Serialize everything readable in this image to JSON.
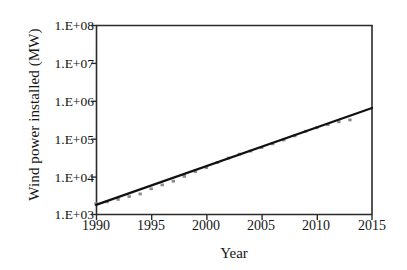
{
  "chart_data": {
    "type": "line",
    "title": "",
    "xlabel": "Year",
    "ylabel": "Wind power installed (MW)",
    "yscale": "log",
    "xlim": [
      1990,
      2015
    ],
    "ylim": [
      1000,
      100000000
    ],
    "grid": false,
    "legend": null,
    "xticklabels": [
      "1990",
      "1995",
      "2000",
      "2005",
      "2010",
      "2015"
    ],
    "xticks": [
      1990,
      1995,
      2000,
      2005,
      2010,
      2015
    ],
    "yticklabels": [
      "1.E+03",
      "1.E+04",
      "1.E+05",
      "1.E+06",
      "1.E+07",
      "1.E+08"
    ],
    "yticks": [
      1000,
      10000,
      100000,
      1000000,
      10000000,
      100000000
    ],
    "series": [
      {
        "name": "Cumulative wind power installed",
        "style": "markers",
        "color": "#8c8c8c",
        "x": [
          1990,
          1991,
          1992,
          1993,
          1994,
          1995,
          1996,
          1997,
          1998,
          1999,
          2000,
          2001,
          2002,
          2003,
          2004,
          2005,
          2006,
          2007,
          2008,
          2009,
          2010,
          2011,
          2012,
          2013
        ],
        "y": [
          1930,
          2170,
          2510,
          2990,
          3490,
          4780,
          6070,
          7600,
          10200,
          13600,
          17400,
          23900,
          31100,
          39431,
          47620,
          59091,
          74052,
          93820,
          120291,
          158864,
          197637,
          238089,
          282482,
          318105
        ]
      },
      {
        "name": "Exponential trend",
        "style": "line",
        "color": "#111111",
        "x": [
          1990,
          2015
        ],
        "y": [
          1800,
          660000
        ]
      }
    ]
  },
  "figure": {
    "background": "#ffffff",
    "axis_color": "#2b2b2b",
    "line_color": "#111111",
    "marker_color": "#8c8c8c"
  }
}
